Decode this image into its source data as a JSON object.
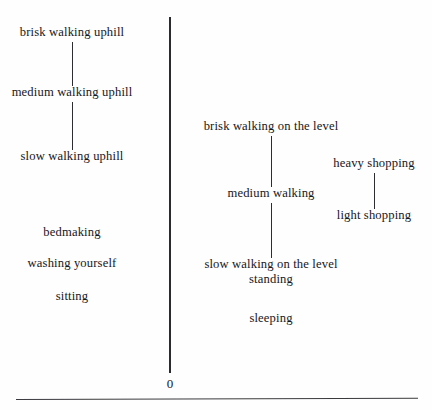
{
  "figure": {
    "axis": {
      "orientation": "vertical",
      "zero_label": "0",
      "top_y_px": 17,
      "bottom_y_px": 372,
      "x_px": 170
    },
    "colors": {
      "ink": "#17161a",
      "line": "#2b2a2e",
      "background": "#fefefe"
    }
  },
  "chart_data": {
    "type": "scatter",
    "xlabel": "",
    "ylabel": "",
    "grid": false,
    "legend": null,
    "axis_tick_labels": [
      "0"
    ],
    "columns": [
      {
        "name": "uphill-walking",
        "x_px": 72,
        "connected": true,
        "items": [
          {
            "label": "brisk walking uphill",
            "y_px": 36,
            "rank": 1
          },
          {
            "label": "medium walking uphill",
            "y_px": 96,
            "rank": 2
          },
          {
            "label": "slow walking uphill",
            "y_px": 160,
            "rank": 3
          }
        ]
      },
      {
        "name": "household-and-rest",
        "x_px": 72,
        "connected": false,
        "items": [
          {
            "label": "bedmaking",
            "y_px": 236,
            "rank": 4
          },
          {
            "label": "washing yourself",
            "y_px": 267,
            "rank": 5
          },
          {
            "label": "sitting",
            "y_px": 300,
            "rank": 6
          }
        ]
      },
      {
        "name": "level-walking",
        "x_px": 271,
        "connected": true,
        "items": [
          {
            "label": "brisk walking on the level",
            "y_px": 130,
            "rank": 1
          },
          {
            "label": "medium walking",
            "y_px": 197,
            "rank": 2
          },
          {
            "label": "slow walking on the level",
            "y_px": 268,
            "rank": 3
          }
        ]
      },
      {
        "name": "low-effort",
        "x_px": 271,
        "connected": false,
        "items": [
          {
            "label": "standing",
            "y_px": 283,
            "rank": 4
          },
          {
            "label": "sleeping",
            "y_px": 322,
            "rank": 5
          }
        ]
      },
      {
        "name": "shopping",
        "x_px": 374,
        "connected": true,
        "items": [
          {
            "label": "heavy shopping",
            "y_px": 167,
            "rank": 1
          },
          {
            "label": "light shopping",
            "y_px": 219,
            "rank": 2
          }
        ]
      }
    ],
    "connectors": [
      {
        "name": "uphill-connector-1",
        "x_px": 72,
        "y1_px": 42,
        "y2_px": 86
      },
      {
        "name": "uphill-connector-2",
        "x_px": 72,
        "y1_px": 102,
        "y2_px": 150
      },
      {
        "name": "level-connector-1",
        "x_px": 271,
        "y1_px": 136,
        "y2_px": 187
      },
      {
        "name": "level-connector-2",
        "x_px": 271,
        "y1_px": 203,
        "y2_px": 258
      },
      {
        "name": "shopping-connector",
        "x_px": 374,
        "y1_px": 173,
        "y2_px": 209
      }
    ]
  }
}
